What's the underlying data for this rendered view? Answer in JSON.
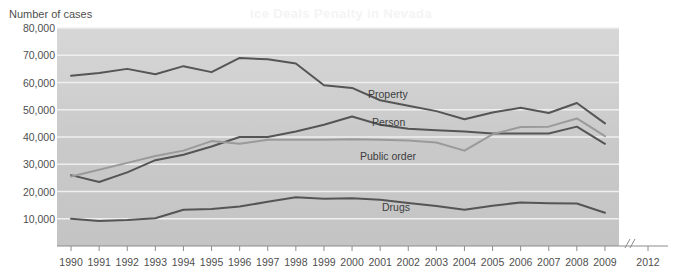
{
  "ghost_text": "ice Deals Penalty in Nevada",
  "axis_title": "Number of cases",
  "axis_break_glyph": "//",
  "colors": {
    "plot_background_top": "#d7d7d7",
    "plot_background_bottom": "#c4c4c4",
    "gridline": "#efefef",
    "dark_line": "#555555",
    "light_line": "#9a9a9a",
    "text": "#4f4f4f",
    "page_background": "#ffffff"
  },
  "series_labels": {
    "property": "Property",
    "person": "Person",
    "public_order": "Public order",
    "drugs": "Drugs"
  },
  "chart_data": {
    "type": "line",
    "title": "",
    "xlabel": "",
    "ylabel": "Number of cases",
    "ylim": [
      0,
      80000
    ],
    "ytick_values": [
      10000,
      20000,
      30000,
      40000,
      50000,
      60000,
      70000,
      80000
    ],
    "ytick_labels": [
      "10,000",
      "20,000",
      "30,000",
      "40,000",
      "50,000",
      "60,000",
      "70,000",
      "80,000"
    ],
    "grid": true,
    "legend": "inline-labels",
    "axis_break_after": "2009",
    "x": [
      1990,
      1991,
      1992,
      1993,
      1994,
      1995,
      1996,
      1997,
      1998,
      1999,
      2000,
      2001,
      2002,
      2003,
      2004,
      2005,
      2006,
      2007,
      2008,
      2009
    ],
    "xtick_labels": [
      "1990",
      "1991",
      "1992",
      "1993",
      "1994",
      "1995",
      "1996",
      "1997",
      "1998",
      "1999",
      "2000",
      "2001",
      "2002",
      "2003",
      "2004",
      "2005",
      "2006",
      "2007",
      "2008",
      "2009",
      "2012"
    ],
    "series": [
      {
        "name": "Property",
        "color": "#555555",
        "values": [
          62500,
          63500,
          65000,
          63000,
          66000,
          63800,
          69000,
          68500,
          67000,
          59000,
          58000,
          53500,
          51500,
          49500,
          46500,
          49000,
          50700,
          48800,
          52500,
          45000
        ]
      },
      {
        "name": "Person",
        "color": "#555555",
        "values": [
          26000,
          23500,
          27000,
          31500,
          33500,
          36500,
          40000,
          40000,
          42000,
          44500,
          47500,
          44500,
          43000,
          42500,
          42000,
          41300,
          41300,
          41300,
          43800,
          37500
        ]
      },
      {
        "name": "Public order",
        "color": "#9a9a9a",
        "values": [
          25500,
          28000,
          30500,
          33000,
          35000,
          38500,
          37500,
          39000,
          39000,
          39000,
          39200,
          39000,
          38700,
          38000,
          35000,
          41000,
          43700,
          43800,
          46800,
          40300
        ]
      },
      {
        "name": "Drugs",
        "color": "#555555",
        "values": [
          10000,
          9200,
          9500,
          10200,
          13300,
          13600,
          14500,
          16200,
          17900,
          17300,
          17500,
          17000,
          15800,
          14700,
          13300,
          14800,
          16000,
          15700,
          15600,
          12200
        ]
      }
    ]
  }
}
